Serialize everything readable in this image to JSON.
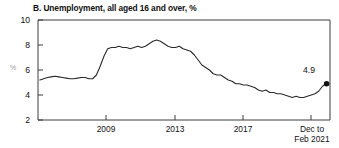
{
  "chart_data": {
    "type": "line",
    "title": "B. Unemployment, all aged 16 and over, %",
    "xlabel": "",
    "ylabel": "%",
    "ylim": [
      2,
      10
    ],
    "yticks": [
      2,
      4,
      6,
      8,
      10
    ],
    "ytick_labels": [
      "2",
      "4",
      "6",
      "8",
      "10"
    ],
    "xticks": [
      2009,
      2013,
      2017,
      2021.12
    ],
    "xtick_labels": [
      "2009",
      "2013",
      "2017",
      "Dec to Feb 2021"
    ],
    "xlim": [
      2005.8,
      2021.3
    ],
    "grid": false,
    "legend": false,
    "line_color": "#2a2a2a",
    "annotation": {
      "text": "4.9",
      "x": 2021.12,
      "y": 4.9,
      "marker": "filled-circle"
    },
    "x": [
      2005.9,
      2006.1,
      2006.3,
      2006.5,
      2006.7,
      2006.9,
      2007.1,
      2007.3,
      2007.5,
      2007.7,
      2007.9,
      2008.1,
      2008.3,
      2008.5,
      2008.7,
      2008.9,
      2009.1,
      2009.3,
      2009.5,
      2009.7,
      2009.9,
      2010.1,
      2010.3,
      2010.5,
      2010.7,
      2010.9,
      2011.1,
      2011.3,
      2011.5,
      2011.7,
      2011.9,
      2012.1,
      2012.3,
      2012.5,
      2012.7,
      2012.9,
      2013.1,
      2013.3,
      2013.5,
      2013.7,
      2013.9,
      2014.1,
      2014.3,
      2014.5,
      2014.7,
      2014.9,
      2015.1,
      2015.3,
      2015.5,
      2015.7,
      2015.9,
      2016.1,
      2016.3,
      2016.5,
      2016.7,
      2016.9,
      2017.1,
      2017.3,
      2017.5,
      2017.7,
      2017.9,
      2018.1,
      2018.3,
      2018.5,
      2018.7,
      2018.9,
      2019.1,
      2019.3,
      2019.5,
      2019.7,
      2019.9,
      2020.1,
      2020.3,
      2020.5,
      2020.7,
      2020.9,
      2021.0,
      2021.12
    ],
    "values": [
      5.2,
      5.3,
      5.4,
      5.45,
      5.5,
      5.45,
      5.4,
      5.35,
      5.3,
      5.3,
      5.35,
      5.4,
      5.4,
      5.3,
      5.3,
      5.6,
      6.3,
      7.1,
      7.7,
      7.8,
      7.8,
      7.9,
      7.8,
      7.8,
      7.7,
      7.8,
      7.9,
      7.8,
      7.9,
      8.1,
      8.3,
      8.4,
      8.3,
      8.1,
      7.9,
      7.8,
      7.8,
      7.9,
      7.7,
      7.6,
      7.5,
      7.2,
      6.8,
      6.4,
      6.2,
      6.0,
      5.7,
      5.6,
      5.6,
      5.4,
      5.2,
      5.1,
      4.9,
      4.9,
      4.8,
      4.8,
      4.7,
      4.6,
      4.4,
      4.3,
      4.4,
      4.2,
      4.2,
      4.1,
      4.1,
      4.0,
      3.9,
      3.8,
      3.9,
      3.8,
      3.8,
      3.9,
      4.0,
      4.1,
      4.3,
      4.7,
      4.8,
      4.9
    ]
  }
}
